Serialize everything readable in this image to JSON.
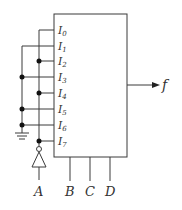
{
  "diagram": {
    "type": "multiplexer-circuit",
    "block": {
      "inputs": [
        {
          "name": "I",
          "sub": "0"
        },
        {
          "name": "I",
          "sub": "1"
        },
        {
          "name": "I",
          "sub": "2"
        },
        {
          "name": "I",
          "sub": "3"
        },
        {
          "name": "I",
          "sub": "4"
        },
        {
          "name": "I",
          "sub": "5"
        },
        {
          "name": "I",
          "sub": "6"
        },
        {
          "name": "I",
          "sub": "7"
        }
      ],
      "selects": [
        "B",
        "C",
        "D"
      ],
      "output": "f"
    },
    "external_input": "A",
    "colors": {
      "line": "#3a3a3a",
      "dot": "#111111",
      "text": "#333333"
    }
  }
}
